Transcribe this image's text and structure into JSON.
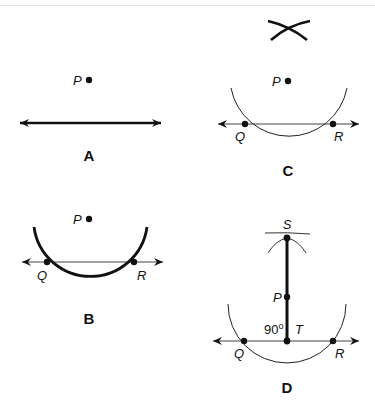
{
  "figure": {
    "panels": [
      {
        "id": "A",
        "label": "A",
        "points": [
          {
            "name": "P"
          }
        ],
        "elements": [
          "line with arrows",
          "point P above line"
        ]
      },
      {
        "id": "B",
        "label": "B",
        "points": [
          {
            "name": "P"
          },
          {
            "name": "Q"
          },
          {
            "name": "R"
          }
        ],
        "elements": [
          "arc centered at P intersecting line at Q and R"
        ]
      },
      {
        "id": "C",
        "label": "C",
        "points": [
          {
            "name": "P"
          },
          {
            "name": "Q"
          },
          {
            "name": "R"
          }
        ],
        "elements": [
          "intersecting arcs drawn from Q and R above P"
        ]
      },
      {
        "id": "D",
        "label": "D",
        "points": [
          {
            "name": "S"
          },
          {
            "name": "P"
          },
          {
            "name": "T"
          },
          {
            "name": "Q"
          },
          {
            "name": "R"
          }
        ],
        "angle_label": "90°",
        "elements": [
          "segment ST through P perpendicular to line at T"
        ]
      }
    ]
  },
  "labels": {
    "a": {
      "P": "P",
      "panel": "A"
    },
    "b": {
      "P": "P",
      "Q": "Q",
      "R": "R",
      "panel": "B"
    },
    "c": {
      "P": "P",
      "Q": "Q",
      "R": "R",
      "panel": "C"
    },
    "d": {
      "S": "S",
      "P": "P",
      "T": "T",
      "Q": "Q",
      "R": "R",
      "angle": "90°",
      "degree_sign": "o",
      "angle_num": "90",
      "panel": "D"
    }
  }
}
